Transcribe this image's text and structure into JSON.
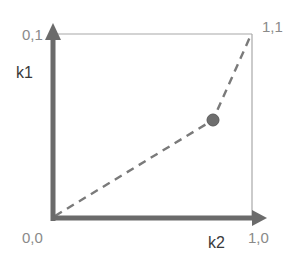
{
  "diagram": {
    "corner_labels": {
      "origin": "0,0",
      "top_left": "0,1",
      "top_right": "1,1",
      "bottom_right": "1,0"
    },
    "axis_labels": {
      "vertical": "k1",
      "horizontal": "k2"
    },
    "path": {
      "style": "dashed",
      "points": [
        [
          0,
          0
        ],
        [
          0.8,
          0.52
        ],
        [
          1,
          1
        ]
      ]
    },
    "point": {
      "x": 0.8,
      "y": 0.52,
      "shape": "circle"
    },
    "colors": {
      "axis": "#6b6b6b",
      "box": "#9a9a9a",
      "dashed_path": "#7a7a7a",
      "point": "#6e6e6e",
      "label": "#8a8a8a",
      "axis_label": "#3a3a3a"
    }
  }
}
